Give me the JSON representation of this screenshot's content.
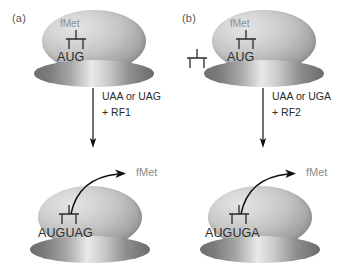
{
  "figure": {
    "background_color": "#ffffff"
  },
  "colors": {
    "large_subunit": "#c2c2c2",
    "small_subunit": "#8e8e8e",
    "codon_text": "#2b2b2b",
    "fmet_text": "#8d8d8d",
    "panel_label_text": "#58595b",
    "arrow": "#111111"
  },
  "panels": [
    {
      "id": "a",
      "label": "(a)",
      "free_trna_present": false,
      "top_complex": {
        "fmet_label": "fMet",
        "codon": "AUG",
        "trna_name": "trna-glyph"
      },
      "reaction": {
        "line1": "UAA or UAG",
        "line2": "+ RF1",
        "factor": "RF1",
        "stop_codons": [
          "UAA",
          "UAG"
        ]
      },
      "bottom_complex": {
        "codon": "AUGUAG",
        "released_label": "fMet",
        "trna_name": "trna-glyph"
      }
    },
    {
      "id": "b",
      "label": "(b)",
      "free_trna_present": true,
      "free_trna_name": "free-trna-glyph",
      "top_complex": {
        "fmet_label": "fMet",
        "codon": "AUG",
        "trna_name": "trna-glyph"
      },
      "reaction": {
        "line1": "UAA or UGA",
        "line2": "+ RF2",
        "factor": "RF2",
        "stop_codons": [
          "UAA",
          "UGA"
        ]
      },
      "bottom_complex": {
        "codon": "AUGUGA",
        "released_label": "fMet",
        "trna_name": "trna-glyph"
      }
    }
  ]
}
